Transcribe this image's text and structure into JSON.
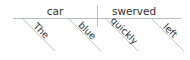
{
  "diagram": {
    "type": "reed-kellogg-sentence-diagram",
    "sentence": "The blue car swerved quickly left.",
    "colors": {
      "background": "#ffffff",
      "line": "#b9bcc0",
      "modifier_line": "#c2c5c9",
      "text": "#2f3133"
    },
    "baseline": {
      "subject": {
        "label": "car",
        "x": 55,
        "y": 14
      },
      "predicate": {
        "label": "swerved",
        "x": 134,
        "y": 14
      }
    },
    "divider": {
      "name": "subject-predicate-divider",
      "x": 97,
      "y1": 5,
      "y2": 27
    },
    "modifiers": [
      {
        "label": "The",
        "attaches_to": "car",
        "line": {
          "x1": 23,
          "y1": 19,
          "x2": 55,
          "y2": 51
        },
        "text_x": 38,
        "text_y": 36,
        "rotation": 45
      },
      {
        "label": "blue",
        "attaches_to": "car",
        "line": {
          "x1": 69,
          "y1": 19,
          "x2": 101,
          "y2": 51
        },
        "text_x": 84,
        "text_y": 36,
        "rotation": 45
      },
      {
        "label": "quickly",
        "attaches_to": "swerved",
        "line": {
          "x1": 106,
          "y1": 19,
          "x2": 138,
          "y2": 51
        },
        "text_x": 121,
        "text_y": 36,
        "rotation": 45
      },
      {
        "label": "left",
        "attaches_to": "swerved",
        "line": {
          "x1": 152,
          "y1": 19,
          "x2": 184,
          "y2": 51
        },
        "text_x": 167,
        "text_y": 36,
        "rotation": 45
      }
    ],
    "main_rule": {
      "name": "main-horizontal-baseline",
      "x1": 13,
      "y1": 19,
      "x2": 181,
      "y2": 19
    }
  }
}
